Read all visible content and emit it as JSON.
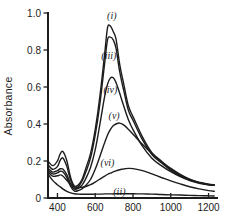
{
  "chart_data": {
    "type": "line",
    "title": "",
    "xlabel": "",
    "ylabel": "Absorbance",
    "xlim": [
      350,
      1250
    ],
    "ylim": [
      0,
      1.0
    ],
    "grid": false,
    "legend_position": "inline-curve-labels",
    "background_color": "#ffffff",
    "line_color": "#1c1c1c",
    "axis_color": "#1c1c1c",
    "text_color": "#1c1c1c",
    "x_ticks": [
      400,
      600,
      800,
      1000,
      1200
    ],
    "x_tick_labels": [
      "400",
      "600",
      "800",
      "1000",
      "1200"
    ],
    "y_ticks": [
      0,
      0.2,
      0.4,
      0.6,
      0.8,
      1.0
    ],
    "y_tick_labels": [
      "0",
      "0.2",
      "0.4",
      "0.6",
      "0.8",
      "1.0"
    ],
    "x": [
      350,
      375,
      400,
      415,
      430,
      450,
      470,
      490,
      510,
      530,
      550,
      575,
      600,
      625,
      650,
      665,
      680,
      695,
      710,
      730,
      750,
      775,
      800,
      850,
      900,
      950,
      1000,
      1050,
      1100,
      1150,
      1200,
      1230
    ],
    "series": [
      {
        "id": "i",
        "name": "(i)",
        "label_pos": {
          "x": 688,
          "y": 0.985
        },
        "values": [
          0.2,
          0.175,
          0.2,
          0.24,
          0.25,
          0.2,
          0.11,
          0.065,
          0.07,
          0.1,
          0.16,
          0.24,
          0.37,
          0.55,
          0.78,
          0.92,
          0.93,
          0.9,
          0.86,
          0.72,
          0.62,
          0.5,
          0.44,
          0.33,
          0.245,
          0.2,
          0.155,
          0.125,
          0.1,
          0.085,
          0.075,
          0.072
        ]
      },
      {
        "id": "iii",
        "name": "(iii)",
        "label_pos": {
          "x": 672,
          "y": 0.77
        },
        "values": [
          0.18,
          0.155,
          0.17,
          0.205,
          0.215,
          0.17,
          0.095,
          0.055,
          0.06,
          0.09,
          0.14,
          0.215,
          0.34,
          0.51,
          0.73,
          0.855,
          0.87,
          0.855,
          0.81,
          0.68,
          0.585,
          0.475,
          0.42,
          0.315,
          0.235,
          0.19,
          0.15,
          0.12,
          0.097,
          0.083,
          0.073,
          0.07
        ]
      },
      {
        "id": "iv",
        "name": "(iv)",
        "label_pos": {
          "x": 680,
          "y": 0.585
        },
        "values": [
          0.16,
          0.14,
          0.148,
          0.158,
          0.155,
          0.125,
          0.075,
          0.048,
          0.052,
          0.07,
          0.105,
          0.165,
          0.26,
          0.4,
          0.55,
          0.615,
          0.648,
          0.65,
          0.625,
          0.565,
          0.5,
          0.425,
          0.37,
          0.28,
          0.215,
          0.175,
          0.142,
          0.115,
          0.094,
          0.08,
          0.071,
          0.068
        ]
      },
      {
        "id": "v",
        "name": "(v)",
        "label_pos": {
          "x": 700,
          "y": 0.445
        },
        "values": [
          0.15,
          0.13,
          0.136,
          0.145,
          0.14,
          0.11,
          0.062,
          0.038,
          0.04,
          0.05,
          0.068,
          0.1,
          0.155,
          0.225,
          0.3,
          0.34,
          0.37,
          0.39,
          0.4,
          0.405,
          0.395,
          0.372,
          0.345,
          0.29,
          0.24,
          0.196,
          0.16,
          0.128,
          0.102,
          0.084,
          0.072,
          0.068
        ]
      },
      {
        "id": "vi",
        "name": "(vi)",
        "label_pos": {
          "x": 665,
          "y": 0.187
        },
        "values": [
          0.14,
          0.118,
          0.12,
          0.125,
          0.118,
          0.095,
          0.072,
          0.06,
          0.057,
          0.058,
          0.062,
          0.072,
          0.086,
          0.102,
          0.118,
          0.127,
          0.134,
          0.141,
          0.147,
          0.153,
          0.157,
          0.16,
          0.159,
          0.148,
          0.13,
          0.111,
          0.093,
          0.076,
          0.061,
          0.049,
          0.04,
          0.036
        ]
      },
      {
        "id": "ii",
        "name": "(ii)",
        "label_pos": {
          "x": 728,
          "y": 0.033
        },
        "values": [
          0.13,
          0.095,
          0.072,
          0.06,
          0.048,
          0.036,
          0.028,
          0.023,
          0.021,
          0.02,
          0.02,
          0.02,
          0.021,
          0.021,
          0.022,
          0.022,
          0.022,
          0.022,
          0.023,
          0.023,
          0.023,
          0.023,
          0.023,
          0.022,
          0.021,
          0.019,
          0.017,
          0.016,
          0.014,
          0.013,
          0.012,
          0.011
        ]
      }
    ]
  }
}
